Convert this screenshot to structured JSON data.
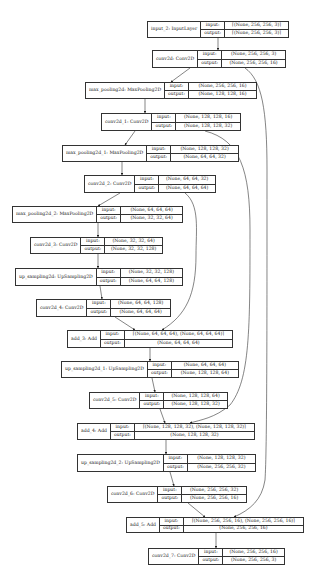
{
  "diagram": {
    "type": "keras-model-plot",
    "input_label": "input:",
    "output_label": "output:",
    "nodes": [
      {
        "id": "input_2",
        "name": "input_2: InputLayer",
        "input": "[(None, 256, 256, 3)]",
        "output": "[(None, 256, 256, 3)]",
        "box": [
          147,
          21,
          142,
          17
        ]
      },
      {
        "id": "conv2d",
        "name": "conv2d: Conv2D",
        "input": "(None, 256, 256, 3)",
        "output": "(None, 256, 256, 16)",
        "box": [
          152,
          50,
          134,
          18
        ]
      },
      {
        "id": "max_pooling2d",
        "name": "max_pooling2d: MaxPooling2D",
        "input": "(None, 256, 256, 16)",
        "output": "(None, 128, 128, 16)",
        "box": [
          85,
          82,
          172,
          17
        ]
      },
      {
        "id": "conv2d_1",
        "name": "conv2d_1: Conv2D",
        "input": "(None, 128, 128, 16)",
        "output": "(None, 128, 128, 32)",
        "box": [
          101,
          113,
          140,
          18
        ]
      },
      {
        "id": "max_pooling2d_1",
        "name": "max_pooling2d_1: MaxPooling2D",
        "input": "(None, 128, 128, 32)",
        "output": "(None, 64, 64, 32)",
        "box": [
          62,
          145,
          177,
          17
        ]
      },
      {
        "id": "conv2d_2",
        "name": "conv2d_2: Conv2D",
        "input": "(None, 64, 64, 32)",
        "output": "(None, 64, 64, 64)",
        "box": [
          84,
          175,
          132,
          18
        ]
      },
      {
        "id": "max_pooling2d_2",
        "name": "max_pooling2d_2: MaxPooling2D",
        "input": "(None, 64, 64, 64)",
        "output": "(None, 32, 32, 64)",
        "box": [
          12,
          206,
          171,
          17
        ]
      },
      {
        "id": "conv2d_3",
        "name": "conv2d_3: Conv2D",
        "input": "(None, 32, 32, 64)",
        "output": "(None, 32, 32, 128)",
        "box": [
          30,
          237,
          133,
          17
        ]
      },
      {
        "id": "up_sampling2d",
        "name": "up_sampling2d: UpSampling2D",
        "input": "(None, 32, 32, 128)",
        "output": "(None, 64, 64, 128)",
        "box": [
          15,
          268,
          168,
          18
        ]
      },
      {
        "id": "conv2d_4",
        "name": "conv2d_4: Conv2D",
        "input": "(None, 64, 64, 128)",
        "output": "(None, 64, 64, 64)",
        "box": [
          36,
          299,
          135,
          18
        ]
      },
      {
        "id": "add_3",
        "name": "add_3: Add",
        "input": "[(None, 64, 64, 64), (None, 64, 64, 64)]",
        "output": "(None, 64, 64, 64)",
        "box": [
          67,
          330,
          166,
          18
        ]
      },
      {
        "id": "up_sampling2d_1",
        "name": "up_sampling2d_1: UpSampling2D",
        "input": "(None, 64, 64, 64)",
        "output": "(None, 128, 128, 64)",
        "box": [
          61,
          361,
          178,
          17
        ]
      },
      {
        "id": "conv2d_5",
        "name": "conv2d_5: Conv2D",
        "input": "(None, 128, 128, 64)",
        "output": "(None, 128, 128, 32)",
        "box": [
          89,
          392,
          139,
          17
        ]
      },
      {
        "id": "add_4",
        "name": "add_4: Add",
        "input": "[(None, 128, 128, 32), (None, 128, 128, 32)]",
        "output": "(None, 128, 128, 32)",
        "box": [
          77,
          423,
          178,
          17
        ]
      },
      {
        "id": "up_sampling2d_2",
        "name": "up_sampling2d_2: UpSampling2D",
        "input": "(None, 128, 128, 32)",
        "output": "(None, 256, 256, 32)",
        "box": [
          77,
          454,
          179,
          18
        ]
      },
      {
        "id": "conv2d_6",
        "name": "conv2d_6: Conv2D",
        "input": "(None, 256, 256, 32)",
        "output": "(None, 256, 256, 16)",
        "box": [
          107,
          486,
          140,
          17
        ]
      },
      {
        "id": "add_5",
        "name": "add_5: Add",
        "input": "[(None, 256, 256, 16), (None, 256, 256, 16)]",
        "output": "(None, 256, 256, 16)",
        "box": [
          126,
          517,
          178,
          16
        ]
      },
      {
        "id": "conv2d_7",
        "name": "conv2d_7: Conv2D",
        "input": "(None, 256, 256, 16)",
        "output": "(None, 256, 256, 3)",
        "box": [
          148,
          548,
          137,
          17
        ]
      }
    ],
    "edges": [
      [
        "input_2",
        "conv2d"
      ],
      [
        "conv2d",
        "max_pooling2d"
      ],
      [
        "max_pooling2d",
        "conv2d_1"
      ],
      [
        "conv2d_1",
        "max_pooling2d_1"
      ],
      [
        "max_pooling2d_1",
        "conv2d_2"
      ],
      [
        "conv2d_2",
        "max_pooling2d_2"
      ],
      [
        "max_pooling2d_2",
        "conv2d_3"
      ],
      [
        "conv2d_3",
        "up_sampling2d"
      ],
      [
        "up_sampling2d",
        "conv2d_4"
      ],
      [
        "conv2d_4",
        "add_3"
      ],
      [
        "conv2d_2",
        "add_3"
      ],
      [
        "add_3",
        "up_sampling2d_1"
      ],
      [
        "up_sampling2d_1",
        "conv2d_5"
      ],
      [
        "conv2d_5",
        "add_4"
      ],
      [
        "conv2d_1",
        "add_4"
      ],
      [
        "add_4",
        "up_sampling2d_2"
      ],
      [
        "up_sampling2d_2",
        "conv2d_6"
      ],
      [
        "conv2d_6",
        "add_5"
      ],
      [
        "conv2d",
        "add_5"
      ],
      [
        "add_5",
        "conv2d_7"
      ]
    ]
  }
}
